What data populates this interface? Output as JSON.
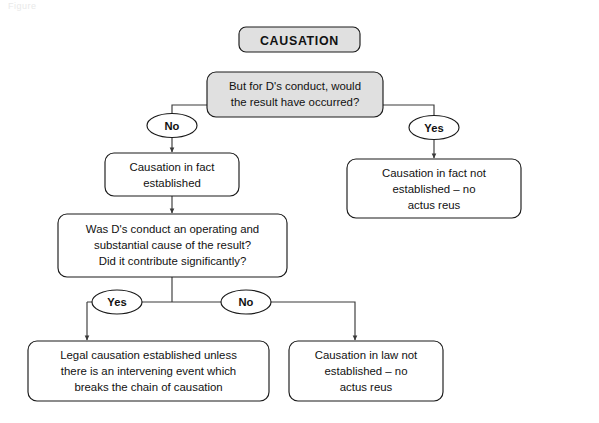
{
  "figure": {
    "caption": "Figure"
  },
  "diagram": {
    "title": "CAUSATION",
    "nodes": {
      "header": "CAUSATION",
      "q1_line1": "But for D's conduct, would",
      "q1_line2": "the result have occurred?",
      "q1_no_label": "No",
      "q1_yes_label": "Yes",
      "fact_established_line1": "Causation in fact",
      "fact_established_line2": "established",
      "fact_not_established_line1": "Causation in fact not",
      "fact_not_established_line2": "established – no",
      "fact_not_established_line3": "actus reus",
      "q2_line1": "Was D's conduct an operating and",
      "q2_line2": "substantial cause of the result?",
      "q2_line3": "Did it contribute significantly?",
      "q2_yes_label": "Yes",
      "q2_no_label": "No",
      "legal_established_line1": "Legal causation established unless",
      "legal_established_line2": "there is an intervening event which",
      "legal_established_line3": "breaks the chain of causation",
      "law_not_established_line1": "Causation in law not",
      "law_not_established_line2": "established – no",
      "law_not_established_line3": "actus reus"
    },
    "colors": {
      "background": "#ffffff",
      "shape_fill_gray": "#e0e0e0",
      "shape_fill_white": "#ffffff",
      "stroke": "#1a1a1a",
      "connector": "#3a3a3a",
      "text": "#111111"
    }
  }
}
